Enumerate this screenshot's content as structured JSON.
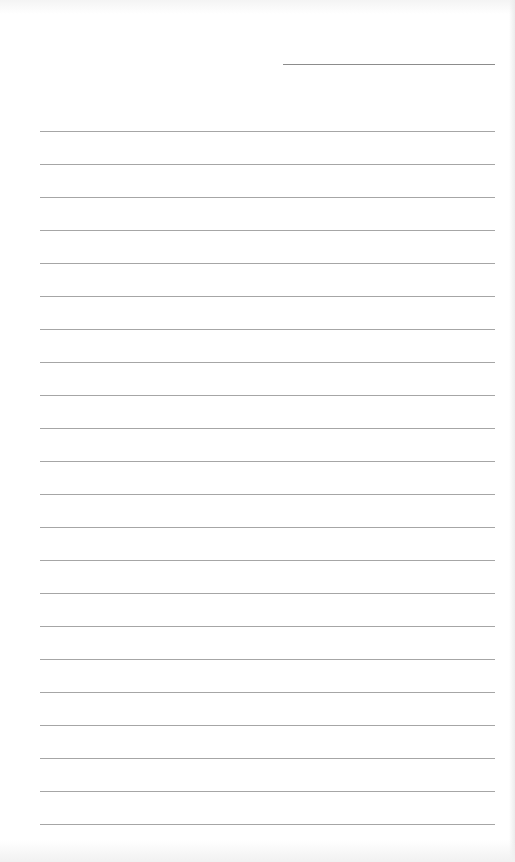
{
  "page": {
    "type": "lined-paper",
    "background_color": "#ffffff",
    "line_color": "#a6a6a6",
    "header_line": {
      "purpose": "date-or-name-field",
      "x": 283,
      "y": 64,
      "width": 212
    },
    "rules": {
      "count": 22,
      "first_y": 131,
      "spacing": 33,
      "x": 40,
      "width": 455
    },
    "text": []
  }
}
